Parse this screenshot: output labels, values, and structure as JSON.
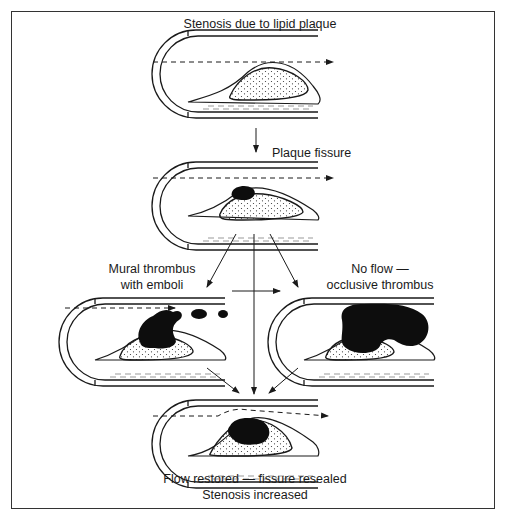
{
  "diagram": {
    "stages": [
      {
        "id": "stenosis",
        "label": "Stenosis due to lipid plaque"
      },
      {
        "id": "fissure",
        "label": "Plaque fissure"
      },
      {
        "id": "mural",
        "label_line1": "Mural thrombus",
        "label_line2": "with emboli"
      },
      {
        "id": "occlusive",
        "label_line1": "No flow —",
        "label_line2": "occlusive thrombus"
      },
      {
        "id": "restored",
        "label_line1": "Flow restored — fissure resealed",
        "label_line2": "Stenosis increased"
      }
    ],
    "colors": {
      "line": "#1a1a1a",
      "thrombus": "#0d0d0d",
      "background": "#ffffff"
    }
  }
}
